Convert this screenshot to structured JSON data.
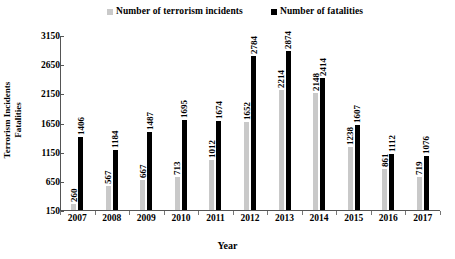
{
  "chart_data": {
    "type": "bar",
    "title": "",
    "xlabel": "Year",
    "ylabel": "Terrorism Incidents\nFatalities",
    "ylabel_line1": "Terrorism Incidents",
    "ylabel_line2": "Fatalities",
    "categories": [
      "2007",
      "2008",
      "2009",
      "2010",
      "2011",
      "2012",
      "2013",
      "2014",
      "2015",
      "2016",
      "2017"
    ],
    "ylim": [
      150,
      3150
    ],
    "yticks": [
      150,
      650,
      1150,
      1650,
      2150,
      2650,
      3150
    ],
    "ytick_labels": [
      "150",
      "650",
      "1150",
      "1650",
      "2150",
      "2650",
      "3150"
    ],
    "grid": false,
    "legend_position": "top",
    "series": [
      {
        "name": "Number of terrorism incidents",
        "color": "#c9c9c9",
        "values": [
          260,
          567,
          667,
          713,
          1012,
          1652,
          2214,
          2148,
          1238,
          861,
          719
        ],
        "value_labels": [
          "260",
          "567",
          "667",
          "713",
          "1012",
          "1652",
          "2214",
          "2148",
          "1238",
          "861",
          "719"
        ]
      },
      {
        "name": "Number of fatalities",
        "color": "#000000",
        "values": [
          1406,
          1184,
          1487,
          1695,
          1674,
          2784,
          2874,
          2414,
          1607,
          1112,
          1076
        ],
        "value_labels": [
          "1406",
          "1184",
          "1487",
          "1695",
          "1674",
          "2784",
          "2874",
          "2414",
          "1607",
          "1112",
          "1076"
        ]
      }
    ]
  }
}
